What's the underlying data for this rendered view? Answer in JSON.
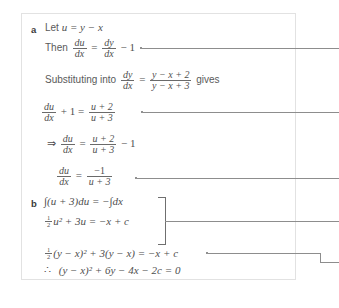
{
  "page": {
    "background_color": "#ffffff",
    "box_border_color": "#e2e2e2",
    "ink_color": "#4f4f4f",
    "connector_color": "#8d8d8d"
  },
  "parts": [
    {
      "label": "a"
    },
    {
      "label": "b"
    }
  ],
  "part_a": {
    "label": "a",
    "lines": [
      {
        "id": "line-let-u",
        "text": "Let u = y − x",
        "prefix_words": "Let",
        "expression": "u = y − x"
      },
      {
        "id": "line-then-du-dx",
        "prefix_words": "Then",
        "fraction_1_num": "du",
        "fraction_1_den": "dx",
        "equals": "=",
        "fraction_2_num": "dy",
        "fraction_2_den": "dx",
        "tail": "− 1"
      },
      {
        "id": "line-substituting",
        "prefix_words": "Substituting into",
        "fraction_1_num": "dy",
        "fraction_1_den": "dx",
        "equals": "=",
        "fraction_2_num": "y − x + 2",
        "fraction_2_den": "y − x + 3",
        "tail_words": "gives"
      },
      {
        "id": "line-du-dx-plus-1",
        "fraction_1_num": "du",
        "fraction_1_den": "dx",
        "middle": "+ 1 =",
        "fraction_2_num": "u + 2",
        "fraction_2_den": "u + 3"
      },
      {
        "id": "line-implies-du-dx",
        "arrow": "⇒",
        "fraction_1_num": "du",
        "fraction_1_den": "dx",
        "equals": "=",
        "fraction_2_num": "u + 2",
        "fraction_2_den": "u + 3",
        "tail": "− 1"
      },
      {
        "id": "line-du-dx-minus1-over",
        "fraction_1_num": "du",
        "fraction_1_den": "dx",
        "equals": "=",
        "fraction_2_num": "−1",
        "fraction_2_den": "u + 3"
      }
    ]
  },
  "part_b": {
    "label": "b",
    "lines": [
      {
        "id": "line-integral",
        "text": "∫(u + 3)du = −∫dx"
      },
      {
        "id": "line-half-u-squared",
        "frac_num": "1",
        "frac_den": "2",
        "rest": "u² + 3u = −x + c"
      },
      {
        "id": "line-substitute-back",
        "frac_num": "1",
        "frac_den": "2",
        "rest": "(y − x)² + 3(y − x) = −x + c"
      },
      {
        "id": "line-final",
        "therefore": "∴",
        "rest": "(y − x)² + 6y − 4x − 2c = 0"
      }
    ]
  },
  "annotations": {
    "connector_count": 5,
    "connectors": [
      {
        "id": "connector-1",
        "from_line": "line-then-du-dx"
      },
      {
        "id": "connector-2",
        "from_line": "line-du-dx-plus-1"
      },
      {
        "id": "connector-3",
        "from_line": "line-du-dx-minus1-over"
      },
      {
        "id": "connector-4",
        "from_line": "bracket-part-b"
      },
      {
        "id": "connector-5",
        "from_line": "line-substitute-back",
        "has_elbow": true
      }
    ],
    "bracket": {
      "id": "bracket-part-b",
      "groups": [
        "line-integral",
        "line-half-u-squared"
      ]
    }
  }
}
